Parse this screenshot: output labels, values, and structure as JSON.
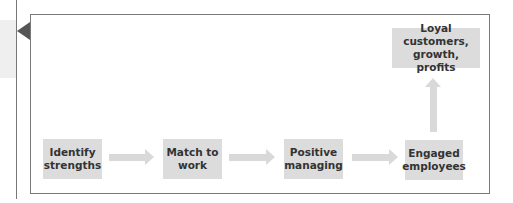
{
  "diagram": {
    "nodes": [
      {
        "id": "identify",
        "label": "Identify strengths",
        "line1": "Identify",
        "line2": "strengths"
      },
      {
        "id": "match",
        "label": "Match to work",
        "line1": "Match to",
        "line2": "work"
      },
      {
        "id": "positive",
        "label": "Positive managing",
        "line1": "Positive",
        "line2": "managing"
      },
      {
        "id": "engaged",
        "label": "Engaged employees",
        "line1": "Engaged",
        "line2": "employees"
      },
      {
        "id": "outcome",
        "label": "Loyal customers, growth, profits",
        "line1": "Loyal customers,",
        "line2": "growth, profits"
      }
    ],
    "edges": [
      {
        "from": "identify",
        "to": "match",
        "direction": "right"
      },
      {
        "from": "match",
        "to": "positive",
        "direction": "right"
      },
      {
        "from": "positive",
        "to": "engaged",
        "direction": "right"
      },
      {
        "from": "engaged",
        "to": "outcome",
        "direction": "up"
      }
    ],
    "colors": {
      "box_fill": "#dcdcdc",
      "arrow_fill": "#d9d9d9",
      "frame_border": "#7a7a7a",
      "pointer": "#555555",
      "text": "#333333"
    }
  }
}
